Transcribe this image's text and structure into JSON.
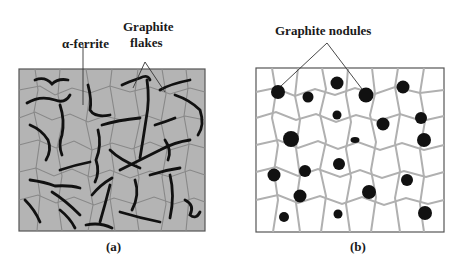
{
  "panels": [
    {
      "id": "a",
      "caption": "(a)",
      "background": "#b4b4b4",
      "grain_color": "#888888",
      "labels": [
        {
          "text": "α-ferrite"
        },
        {
          "text": "Graphite"
        },
        {
          "text": "flakes"
        }
      ]
    },
    {
      "id": "b",
      "caption": "(b)",
      "background": "#ffffff",
      "grain_color": "#b0b0b0",
      "labels": [
        {
          "text": "Graphite nodules"
        }
      ]
    }
  ],
  "colors": {
    "graphite": "#111111",
    "border": "#555555"
  }
}
